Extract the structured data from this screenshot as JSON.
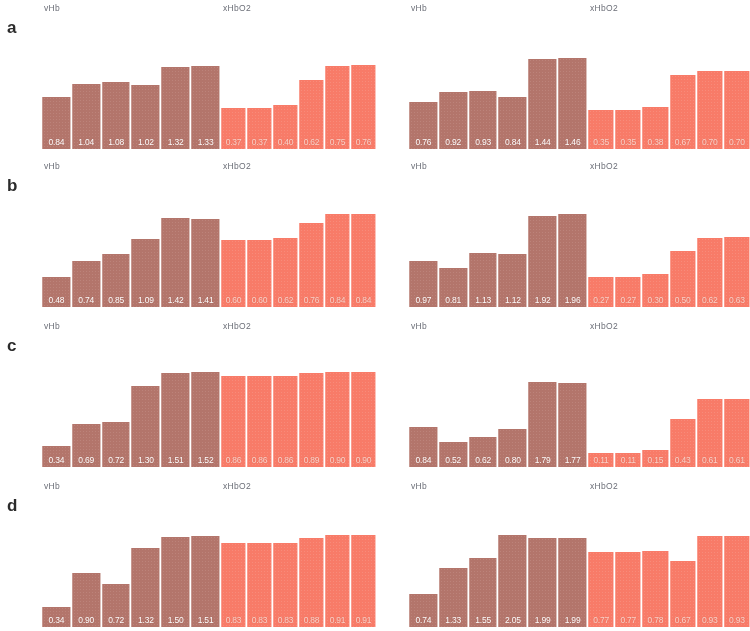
{
  "figure": {
    "panel_letters": [
      "a",
      "b",
      "c",
      "d"
    ],
    "vhb_label": "vHb",
    "xhbo2_label": "xHbO2",
    "colors": {
      "vhb_bar": "#b5756a",
      "xhbo2_bar": "#fb7a67",
      "value_text": "#ffffff",
      "title_text": "#6c6f78",
      "letter_text": "#2b2b2b",
      "background": "#ffffff"
    }
  },
  "chart_data": [
    {
      "type": "bar",
      "panel": "a",
      "column": "left",
      "title": "vHb",
      "categories": [
        "1",
        "2",
        "3",
        "4",
        "5",
        "6"
      ],
      "values": [
        0.84,
        1.04,
        1.08,
        1.02,
        1.32,
        1.33
      ],
      "labels": [
        "0.84",
        "1.04",
        "1.08",
        "1.02",
        "1.32",
        "1.33"
      ],
      "ylim": [
        0,
        1.6
      ],
      "grid": false,
      "legend": "none"
    },
    {
      "type": "bar",
      "panel": "a",
      "column": "left",
      "title": "xHbO2",
      "categories": [
        "1",
        "2",
        "3",
        "4",
        "5",
        "6"
      ],
      "values": [
        0.37,
        0.37,
        0.4,
        0.62,
        0.75,
        0.76
      ],
      "labels": [
        "0.37",
        "0.37",
        "0.40",
        "0.62",
        "0.75",
        "0.76"
      ],
      "ylim": [
        0,
        0.9
      ],
      "grid": false,
      "legend": "none"
    },
    {
      "type": "bar",
      "panel": "a",
      "column": "right",
      "title": "vHb",
      "categories": [
        "1",
        "2",
        "3",
        "4",
        "5",
        "6"
      ],
      "values": [
        0.76,
        0.92,
        0.93,
        0.84,
        1.44,
        1.46
      ],
      "labels": [
        "0.76",
        "0.92",
        "0.93",
        "0.84",
        "1.44",
        "1.46"
      ],
      "ylim": [
        0,
        1.6
      ],
      "grid": false,
      "legend": "none"
    },
    {
      "type": "bar",
      "panel": "a",
      "column": "right",
      "title": "xHbO2",
      "categories": [
        "1",
        "2",
        "3",
        "4",
        "5",
        "6"
      ],
      "values": [
        0.35,
        0.35,
        0.38,
        0.67,
        0.7,
        0.7
      ],
      "labels": [
        "0.35",
        "0.35",
        "0.38",
        "0.67",
        "0.70",
        "0.70"
      ],
      "ylim": [
        0,
        0.9
      ],
      "grid": false,
      "legend": "none"
    },
    {
      "type": "bar",
      "panel": "b",
      "column": "left",
      "title": "vHb",
      "categories": [
        "1",
        "2",
        "3",
        "4",
        "5",
        "6"
      ],
      "values": [
        0.48,
        0.74,
        0.85,
        1.09,
        1.42,
        1.41
      ],
      "labels": [
        "0.48",
        "0.74",
        "0.85",
        "1.09",
        "1.42",
        "1.41"
      ],
      "ylim": [
        0,
        1.6
      ],
      "grid": false,
      "legend": "none"
    },
    {
      "type": "bar",
      "panel": "b",
      "column": "left",
      "title": "xHbO2",
      "categories": [
        "1",
        "2",
        "3",
        "4",
        "5",
        "6"
      ],
      "values": [
        0.6,
        0.6,
        0.62,
        0.76,
        0.84,
        0.84
      ],
      "labels": [
        "0.60",
        "0.60",
        "0.62",
        "0.76",
        "0.84",
        "0.84"
      ],
      "ylim": [
        0,
        0.9
      ],
      "grid": false,
      "legend": "none"
    },
    {
      "type": "bar",
      "panel": "b",
      "column": "right",
      "title": "vHb",
      "categories": [
        "1",
        "2",
        "3",
        "4",
        "5",
        "6"
      ],
      "values": [
        0.97,
        0.81,
        1.13,
        1.12,
        1.92,
        1.96
      ],
      "labels": [
        "0.97",
        "0.81",
        "1.13",
        "1.12",
        "1.92",
        "1.96"
      ],
      "ylim": [
        0,
        2.1
      ],
      "grid": false,
      "legend": "none"
    },
    {
      "type": "bar",
      "panel": "b",
      "column": "right",
      "title": "xHbO2",
      "categories": [
        "1",
        "2",
        "3",
        "4",
        "5",
        "6"
      ],
      "values": [
        0.27,
        0.27,
        0.3,
        0.5,
        0.62,
        0.63
      ],
      "labels": [
        "0.27",
        "0.27",
        "0.30",
        "0.50",
        "0.62",
        "0.63"
      ],
      "ylim": [
        0,
        0.9
      ],
      "grid": false,
      "legend": "none"
    },
    {
      "type": "bar",
      "panel": "c",
      "column": "left",
      "title": "vHb",
      "categories": [
        "1",
        "2",
        "3",
        "4",
        "5",
        "6"
      ],
      "values": [
        0.34,
        0.69,
        0.72,
        1.3,
        1.51,
        1.52
      ],
      "labels": [
        "0.34",
        "0.69",
        "0.72",
        "1.30",
        "1.51",
        "1.52"
      ],
      "ylim": [
        0,
        1.6
      ],
      "grid": false,
      "legend": "none"
    },
    {
      "type": "bar",
      "panel": "c",
      "column": "left",
      "title": "xHbO2",
      "categories": [
        "1",
        "2",
        "3",
        "4",
        "5",
        "6"
      ],
      "values": [
        0.86,
        0.86,
        0.86,
        0.89,
        0.9,
        0.9
      ],
      "labels": [
        "0.86",
        "0.86",
        "0.86",
        "0.89",
        "0.90",
        "0.90"
      ],
      "ylim": [
        0,
        0.95
      ],
      "grid": false,
      "legend": "none"
    },
    {
      "type": "bar",
      "panel": "c",
      "column": "right",
      "title": "vHb",
      "categories": [
        "1",
        "2",
        "3",
        "4",
        "5",
        "6"
      ],
      "values": [
        0.84,
        0.52,
        0.62,
        0.8,
        1.79,
        1.77
      ],
      "labels": [
        "0.84",
        "0.52",
        "0.62",
        "0.80",
        "1.79",
        "1.77"
      ],
      "ylim": [
        0,
        2.1
      ],
      "grid": false,
      "legend": "none"
    },
    {
      "type": "bar",
      "panel": "c",
      "column": "right",
      "title": "xHbO2",
      "categories": [
        "1",
        "2",
        "3",
        "4",
        "5",
        "6"
      ],
      "values": [
        0.11,
        0.11,
        0.15,
        0.43,
        0.61,
        0.61
      ],
      "labels": [
        "0.11",
        "0.11",
        "0.15",
        "0.43",
        "0.61",
        "0.61"
      ],
      "ylim": [
        0,
        0.9
      ],
      "grid": false,
      "legend": "none"
    },
    {
      "type": "bar",
      "panel": "d",
      "column": "left",
      "title": "vHb",
      "categories": [
        "1",
        "2",
        "3",
        "4",
        "5",
        "6"
      ],
      "values": [
        0.34,
        0.9,
        0.72,
        1.32,
        1.5,
        1.51
      ],
      "labels": [
        "0.34",
        "0.90",
        "0.72",
        "1.32",
        "1.50",
        "1.51"
      ],
      "ylim": [
        0,
        1.6
      ],
      "grid": false,
      "legend": "none"
    },
    {
      "type": "bar",
      "panel": "d",
      "column": "left",
      "title": "xHbO2",
      "categories": [
        "1",
        "2",
        "3",
        "4",
        "5",
        "6"
      ],
      "values": [
        0.83,
        0.83,
        0.83,
        0.88,
        0.91,
        0.91
      ],
      "labels": [
        "0.83",
        "0.83",
        "0.83",
        "0.88",
        "0.91",
        "0.91"
      ],
      "ylim": [
        0,
        0.95
      ],
      "grid": false,
      "legend": "none"
    },
    {
      "type": "bar",
      "panel": "d",
      "column": "right",
      "title": "vHb",
      "categories": [
        "1",
        "2",
        "3",
        "4",
        "5",
        "6"
      ],
      "values": [
        0.74,
        1.33,
        1.55,
        2.05,
        1.99,
        1.99
      ],
      "labels": [
        "0.74",
        "1.33",
        "1.55",
        "2.05",
        "1.99",
        "1.99"
      ],
      "ylim": [
        0,
        2.15
      ],
      "grid": false,
      "legend": "none"
    },
    {
      "type": "bar",
      "panel": "d",
      "column": "right",
      "title": "xHbO2",
      "categories": [
        "1",
        "2",
        "3",
        "4",
        "5",
        "6"
      ],
      "values": [
        0.77,
        0.77,
        0.78,
        0.67,
        0.93,
        0.93
      ],
      "labels": [
        "0.77",
        "0.77",
        "0.78",
        "0.67",
        "0.93",
        "0.93"
      ],
      "ylim": [
        0,
        0.98
      ],
      "grid": false,
      "legend": "none"
    }
  ]
}
